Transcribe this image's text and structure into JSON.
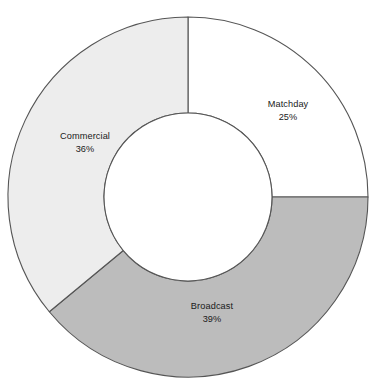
{
  "chart_data": {
    "type": "pie",
    "variant": "donut",
    "title": "",
    "subtitle": "",
    "xlabel": "",
    "ylabel": "",
    "grid": false,
    "legend": "none",
    "labels_inside_slices": true,
    "start_angle_deg": 0,
    "direction": "clockwise",
    "categories": [
      "Matchday",
      "Broadcast",
      "Commercial"
    ],
    "values": [
      25,
      39,
      36
    ],
    "value_suffix": "%",
    "slices": [
      {
        "name": "Matchday",
        "value": 25,
        "value_label": "25%",
        "color": "#ffffff",
        "start_deg": 0,
        "end_deg": 90,
        "label_x": 288,
        "label_y": 110
      },
      {
        "name": "Broadcast",
        "value": 39,
        "value_label": "39%",
        "color": "#bcbcbc",
        "start_deg": 90,
        "end_deg": 230.4,
        "label_x": 212,
        "label_y": 312
      },
      {
        "name": "Commercial",
        "value": 36,
        "value_label": "36%",
        "color": "#ededed",
        "start_deg": 230.4,
        "end_deg": 360,
        "label_x": 85,
        "label_y": 142
      }
    ],
    "geometry": {
      "center_x": 188,
      "center_y": 197,
      "outer_radius": 180,
      "inner_radius": 84
    },
    "style": {
      "stroke_color": "#555555",
      "stroke_width": 1.1,
      "background": "#ffffff",
      "text_color": "#1a1a1a"
    }
  }
}
